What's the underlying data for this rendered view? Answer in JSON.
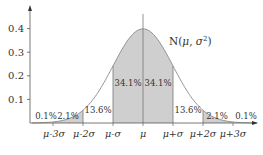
{
  "chart_data": {
    "type": "area",
    "xlabel": "",
    "ylabel": "",
    "ylim": [
      0,
      0.45
    ],
    "xlim_sigma": [
      -3.7,
      3.8
    ],
    "grid": false,
    "legend": null,
    "y_ticks": [
      "0.1",
      "0.2",
      "0.3",
      "0.4"
    ],
    "x_ticks": [
      "μ-3σ",
      "μ-2σ",
      "μ-σ",
      "μ",
      "μ+σ",
      "μ+2σ",
      "μ+3σ"
    ],
    "curve": "normal density with mean μ and std σ; peak ≈ 0.399 at μ",
    "regions": [
      {
        "range": "< μ-3σ",
        "percent": "0.1%",
        "shaded": false
      },
      {
        "range": "μ-3σ to μ-2σ",
        "percent": "2.1%",
        "shaded": true
      },
      {
        "range": "μ-2σ to μ-σ",
        "percent": "13.6%",
        "shaded": false
      },
      {
        "range": "μ-σ to μ",
        "percent": "34.1%",
        "shaded": true
      },
      {
        "range": "μ to μ+σ",
        "percent": "34.1%",
        "shaded": true
      },
      {
        "range": "μ+σ to μ+2σ",
        "percent": "13.6%",
        "shaded": false
      },
      {
        "range": "μ+2σ to μ+3σ",
        "percent": "2.1%",
        "shaded": true
      },
      {
        "range": "> μ+3σ",
        "percent": "0.1%",
        "shaded": false
      }
    ],
    "annotation": "N(μ, σ²)",
    "colors": {
      "shade": "#cfcfcf",
      "line": "#777777",
      "axis": "#555555"
    }
  },
  "labels": {
    "y": [
      "0.1",
      "0.2",
      "0.3",
      "0.4"
    ],
    "x": [
      "μ-3σ",
      "μ-2σ",
      "μ-σ",
      "μ",
      "μ+σ",
      "μ+2σ",
      "μ+3σ"
    ],
    "pct": {
      "far_left": "0.1%",
      "left2": "2.1%",
      "left1": "13.6%",
      "center_left": "34.1%",
      "center_right": "34.1%",
      "right1": "13.6%",
      "right2": "2.1%",
      "far_right": "0.1%"
    },
    "title_prefix": "N(",
    "title_mu": "μ",
    "title_sep": ", ",
    "title_sigma": "σ",
    "title_sup": "2",
    "title_suffix": ")"
  }
}
